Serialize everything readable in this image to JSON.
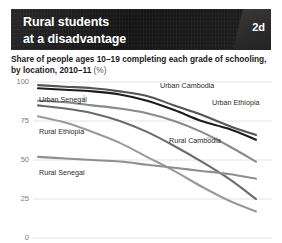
{
  "header": {
    "title_line1": "Rural students",
    "title_line2": "at a disadvantage",
    "badge": "2d",
    "badge_color": "#2f2f2f",
    "banner_color": "#1b1b1b"
  },
  "subtitle": {
    "text": "Share of people ages 10–19 completing each grade of schooling, by location, 2010–11",
    "unit": "(%)"
  },
  "chart_data": {
    "type": "line",
    "title": "Rural students at a disadvantage",
    "subtitle": "Share of people ages 10–19 completing each grade of schooling, by location, 2010–11 (%)",
    "xlabel": "",
    "ylabel": "",
    "ylim": [
      0,
      100
    ],
    "yticks": [
      0,
      25,
      50,
      75,
      100
    ],
    "ytick_labels": [
      "0",
      "25",
      "50",
      "75",
      "100"
    ],
    "grid": true,
    "grid_axis": "y",
    "legend": "inline-labels",
    "x": [
      1,
      2,
      3,
      4,
      5,
      6,
      7,
      8,
      9
    ],
    "series": [
      {
        "name": "Urban Cambodia",
        "color": "#555555",
        "label_x": 160,
        "label_y": 81,
        "values": [
          98,
          97,
          96,
          94,
          91,
          85,
          79,
          72,
          66
        ]
      },
      {
        "name": "Urban Ethiopia",
        "color": "#1c1c1c",
        "label_x": 212,
        "label_y": 98,
        "values": [
          96,
          95,
          94,
          92,
          88,
          82,
          75,
          70,
          63
        ]
      },
      {
        "name": "Urban Senegal",
        "color": "#8a8a8a",
        "label_x": 39,
        "label_y": 95,
        "values": [
          88,
          87,
          85,
          83,
          80,
          75,
          68,
          59,
          49
        ]
      },
      {
        "name": "Rural Ethiopia",
        "color": "#6b6b6b",
        "label_x": 39,
        "label_y": 127,
        "values": [
          85,
          83,
          80,
          75,
          68,
          59,
          49,
          38,
          25
        ]
      },
      {
        "name": "Rural Cambodia",
        "color": "#9a9a9a",
        "label_x": 169,
        "label_y": 136,
        "values": [
          78,
          74,
          68,
          61,
          52,
          43,
          33,
          24,
          17
        ]
      },
      {
        "name": "Rural Senegal",
        "color": "#8f8f8f",
        "label_x": 39,
        "label_y": 168,
        "values": [
          52,
          51,
          50,
          49,
          47,
          45,
          43,
          41,
          38
        ]
      }
    ]
  }
}
